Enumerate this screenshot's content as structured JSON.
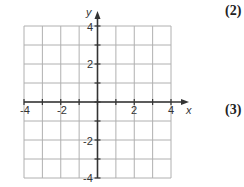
{
  "chart_data": {
    "type": "coordinate-grid",
    "title": "",
    "xlabel": "x",
    "ylabel": "y",
    "xlim": [
      -4,
      4
    ],
    "ylim": [
      -4,
      4
    ],
    "grid": true,
    "grid_step": 1,
    "x_tick_labels": [
      "-4",
      "-2",
      "2",
      "4"
    ],
    "y_tick_labels": [
      "4",
      "2",
      "-2",
      "-4"
    ],
    "series": []
  },
  "markers": {
    "top": "(2)",
    "middle": "(3)"
  },
  "colors": {
    "grid": "#b0b0b0",
    "axis": "#333333",
    "text": "#333333"
  }
}
